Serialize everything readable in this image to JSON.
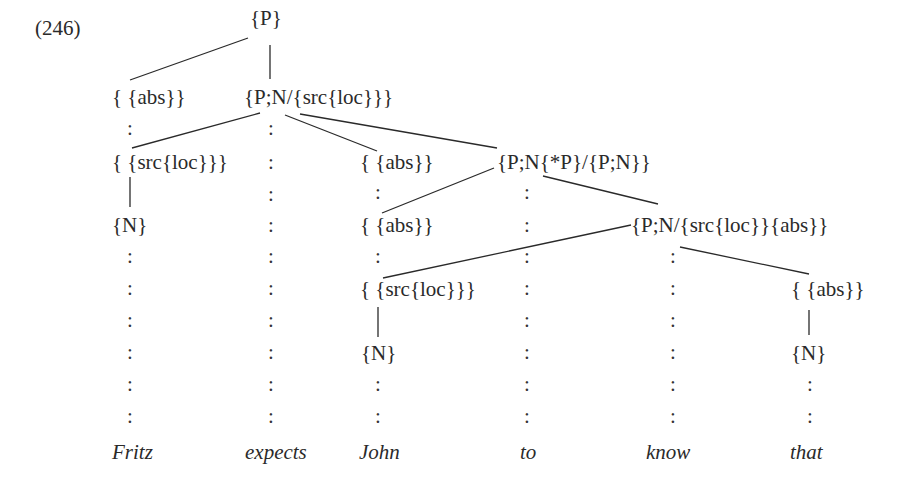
{
  "example_number": "(246)",
  "nodes": {
    "root": "{P}",
    "abs_fritz": "{ {abs}}",
    "expects_head": "{P;N/{src{loc}}}",
    "src_fritz": "{ {src{loc}}}",
    "abs_john_top": "{ {abs}}",
    "to_head": "{P;N{*P}/{P;N}}",
    "n_fritz": "{N}",
    "abs_john": "{ {abs}}",
    "know_head": "{P;N/{src{loc}}{abs}}",
    "src_john": "{ {src{loc}}}",
    "abs_that": "{ {abs}}",
    "n_john": "{N}",
    "n_that": "{N}"
  },
  "words": [
    "Fritz",
    "expects",
    "John",
    "to",
    "know",
    "that"
  ],
  "connector": ":"
}
